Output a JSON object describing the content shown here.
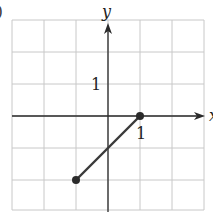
{
  "figure_label": ")",
  "chart_data": {
    "type": "line",
    "title": "",
    "xlabel": "x",
    "ylabel": "y",
    "xlim": [
      -3,
      3
    ],
    "ylim": [
      -3,
      3
    ],
    "grid": true,
    "tick_labels": {
      "x": [
        "1"
      ],
      "y": [
        "1"
      ]
    },
    "series": [
      {
        "name": "segment",
        "x": [
          -1,
          1
        ],
        "y": [
          -2,
          0
        ],
        "endpoints": "closed"
      }
    ]
  },
  "colors": {
    "grid": "#c8c8c8",
    "axis": "#2a2a2a",
    "line": "#3a3a3a",
    "point": "#2a2a2a"
  }
}
